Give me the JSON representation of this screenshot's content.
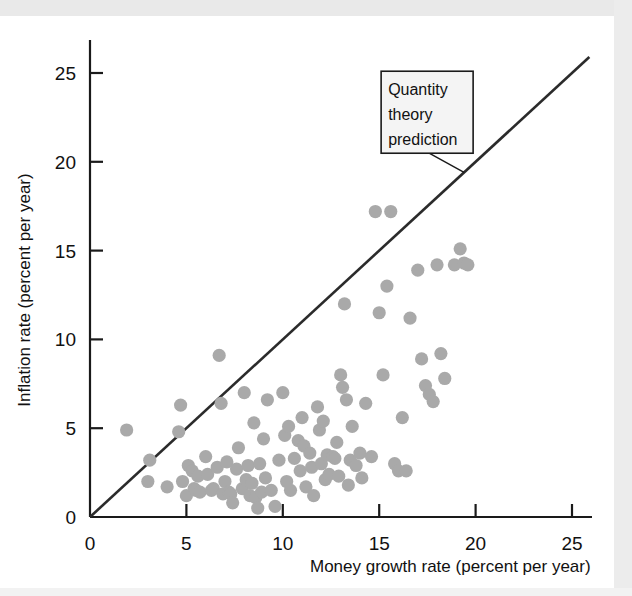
{
  "figure": {
    "background_color": "#ffffff",
    "axis_color": "#1a1a1a",
    "point_color": "#a9a9a9",
    "line_color": "#2b2b2b",
    "annotation_box_fill": "#f4f4f4",
    "annotation_box_border": "#1a1a1a"
  },
  "annotation": {
    "line1": "Quantity",
    "line2": "theory",
    "line3": "prediction"
  },
  "chart_data": {
    "type": "scatter",
    "title": "",
    "xlabel": "Money growth rate (percent per year)",
    "ylabel": "Inflation rate (percent per year)",
    "xlim": [
      0,
      26.5
    ],
    "ylim": [
      0,
      26.8
    ],
    "xticks": [
      0,
      5,
      10,
      15,
      20,
      25
    ],
    "xtick_labels": [
      "0",
      "5",
      "10",
      "15",
      "20",
      "25"
    ],
    "yticks": [
      0,
      5,
      10,
      15,
      20,
      25
    ],
    "ytick_labels": [
      "0",
      "5",
      "10",
      "15",
      "20",
      "25"
    ],
    "grid": false,
    "legend": "none",
    "annotations": [
      {
        "text": "Quantity theory prediction",
        "target_x": 19.4,
        "target_y": 19.4,
        "box_x": 15.1,
        "box_y": 25.1
      }
    ],
    "reference_line": {
      "name": "Quantity theory prediction",
      "type": "identity",
      "slope": 1,
      "intercept": 0,
      "x_range": [
        0,
        25.9
      ],
      "y_range": [
        0,
        25.9
      ],
      "color": "#2b2b2b"
    },
    "series": [
      {
        "name": "Countries",
        "marker": "circle",
        "color": "#a9a9a9",
        "points": [
          [
            1.9,
            4.9
          ],
          [
            3.0,
            2.0
          ],
          [
            3.1,
            3.2
          ],
          [
            4.0,
            1.7
          ],
          [
            4.6,
            4.8
          ],
          [
            4.7,
            6.3
          ],
          [
            4.8,
            2.0
          ],
          [
            5.0,
            1.2
          ],
          [
            5.1,
            2.9
          ],
          [
            5.3,
            2.6
          ],
          [
            5.4,
            1.6
          ],
          [
            5.5,
            1.5
          ],
          [
            5.6,
            2.3
          ],
          [
            5.7,
            1.4
          ],
          [
            6.0,
            3.4
          ],
          [
            6.1,
            2.4
          ],
          [
            6.3,
            1.5
          ],
          [
            6.4,
            1.6
          ],
          [
            6.6,
            2.8
          ],
          [
            6.7,
            9.1
          ],
          [
            6.8,
            6.4
          ],
          [
            6.9,
            1.3
          ],
          [
            7.0,
            2.0
          ],
          [
            7.1,
            3.1
          ],
          [
            7.2,
            1.4
          ],
          [
            7.3,
            1.3
          ],
          [
            7.4,
            0.8
          ],
          [
            7.6,
            2.7
          ],
          [
            7.7,
            3.9
          ],
          [
            7.9,
            1.6
          ],
          [
            8.0,
            7.0
          ],
          [
            8.1,
            2.1
          ],
          [
            8.2,
            2.9
          ],
          [
            8.3,
            1.2
          ],
          [
            8.4,
            1.9
          ],
          [
            8.5,
            5.3
          ],
          [
            8.6,
            1.1
          ],
          [
            8.7,
            0.5
          ],
          [
            8.8,
            3.0
          ],
          [
            8.9,
            1.4
          ],
          [
            9.0,
            4.4
          ],
          [
            9.1,
            2.2
          ],
          [
            9.2,
            6.6
          ],
          [
            9.4,
            1.5
          ],
          [
            9.6,
            0.6
          ],
          [
            9.8,
            3.2
          ],
          [
            10.0,
            7.0
          ],
          [
            10.1,
            4.6
          ],
          [
            10.2,
            2.0
          ],
          [
            10.3,
            5.1
          ],
          [
            10.4,
            1.5
          ],
          [
            10.6,
            3.3
          ],
          [
            10.8,
            4.3
          ],
          [
            10.9,
            2.6
          ],
          [
            11.0,
            5.6
          ],
          [
            11.1,
            4.0
          ],
          [
            11.2,
            1.7
          ],
          [
            11.4,
            3.6
          ],
          [
            11.5,
            2.8
          ],
          [
            11.6,
            1.2
          ],
          [
            11.8,
            6.2
          ],
          [
            11.9,
            4.9
          ],
          [
            12.0,
            3.0
          ],
          [
            12.1,
            5.4
          ],
          [
            12.2,
            2.1
          ],
          [
            12.3,
            3.5
          ],
          [
            12.4,
            2.4
          ],
          [
            12.6,
            3.4
          ],
          [
            12.7,
            3.3
          ],
          [
            12.8,
            4.2
          ],
          [
            12.9,
            2.3
          ],
          [
            13.0,
            8.0
          ],
          [
            13.1,
            7.3
          ],
          [
            13.2,
            12.0
          ],
          [
            13.3,
            6.6
          ],
          [
            13.4,
            1.8
          ],
          [
            13.5,
            3.2
          ],
          [
            13.6,
            5.1
          ],
          [
            13.8,
            2.9
          ],
          [
            14.0,
            3.6
          ],
          [
            14.1,
            2.2
          ],
          [
            14.3,
            6.4
          ],
          [
            14.6,
            3.4
          ],
          [
            14.8,
            17.2
          ],
          [
            15.0,
            11.5
          ],
          [
            15.2,
            8.0
          ],
          [
            15.4,
            13.0
          ],
          [
            15.6,
            17.2
          ],
          [
            15.8,
            3.0
          ],
          [
            16.0,
            2.6
          ],
          [
            16.2,
            5.6
          ],
          [
            16.4,
            2.6
          ],
          [
            16.6,
            11.2
          ],
          [
            17.0,
            13.9
          ],
          [
            17.2,
            8.9
          ],
          [
            17.4,
            7.4
          ],
          [
            17.6,
            6.9
          ],
          [
            17.8,
            6.5
          ],
          [
            18.0,
            14.2
          ],
          [
            18.2,
            9.2
          ],
          [
            18.4,
            7.8
          ],
          [
            18.9,
            14.2
          ],
          [
            19.2,
            15.1
          ],
          [
            19.4,
            14.3
          ],
          [
            19.6,
            14.2
          ]
        ]
      }
    ]
  }
}
